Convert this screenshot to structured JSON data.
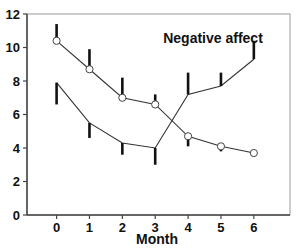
{
  "chart_data": {
    "type": "line",
    "title": "Negative affect",
    "xlabel": "Month",
    "ylabel": "",
    "x": [
      0,
      1,
      2,
      3,
      4,
      5,
      6
    ],
    "xticks": [
      "0",
      "1",
      "2",
      "3",
      "4",
      "5",
      "6"
    ],
    "yticks": [
      "0",
      "2",
      "4",
      "6",
      "8",
      "10",
      "12"
    ],
    "ylim": [
      0,
      12
    ],
    "xlim": [
      -0.9,
      7.1
    ],
    "grid": false,
    "legend": null,
    "series": [
      {
        "name": "Group with circle markers",
        "marker": "open-circle",
        "values": [
          10.4,
          8.7,
          7.0,
          6.6,
          4.7,
          4.1,
          3.7
        ],
        "error_bar_direction": [
          "up",
          "up",
          "up",
          "up",
          "down",
          "down",
          "down"
        ],
        "error_bar": [
          1.0,
          1.2,
          1.2,
          0.6,
          0.6,
          0.3,
          0.2
        ]
      },
      {
        "name": "Group without markers",
        "marker": "none",
        "values": [
          7.9,
          5.5,
          4.3,
          4.0,
          7.2,
          7.7,
          9.3
        ],
        "error_bar_direction": [
          "down",
          "down",
          "down",
          "down",
          "up",
          "up",
          "up"
        ],
        "error_bar": [
          1.3,
          0.9,
          0.7,
          1.0,
          1.3,
          0.8,
          1.1
        ]
      }
    ],
    "colors": {
      "line": "#333333",
      "axis": "#444444",
      "text": "#111111"
    }
  }
}
